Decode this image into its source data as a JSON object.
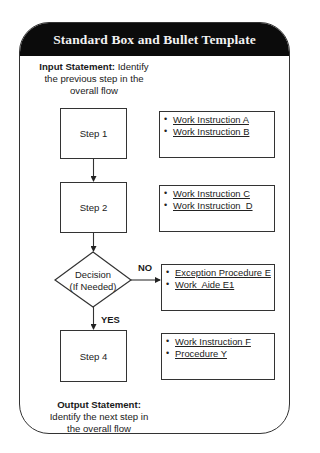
{
  "header": {
    "title": "Standard Box and Bullet Template"
  },
  "input_statement": {
    "label": "Input Statement:",
    "text_line1": " Identify",
    "text_line2": "the previous step in the",
    "text_line3": "overall flow"
  },
  "steps": [
    {
      "label": "Step 1",
      "bullets": [
        "Work Instruction A",
        "Work Instruction B"
      ]
    },
    {
      "label": "Step 2",
      "bullets": [
        "Work Instruction C",
        "Work Instruction  D"
      ]
    },
    {
      "label": "Decision",
      "sublabel": "(If Needed)",
      "bullets": [
        "Exception Procedure E",
        "Work  Aide E1"
      ]
    },
    {
      "label": "Step 4",
      "bullets": [
        "Work Instruction F",
        "Procedure Y"
      ]
    }
  ],
  "decision_branches": {
    "no_label": "NO",
    "yes_label": "YES"
  },
  "output_statement": {
    "label": "Output Statement:",
    "text_line1": "Identify the next step in",
    "text_line2": "the overall flow"
  },
  "colors": {
    "header_bg": "#0b0b0b",
    "header_text": "#f2f2f2",
    "stroke": "#333333",
    "background": "#ffffff"
  }
}
